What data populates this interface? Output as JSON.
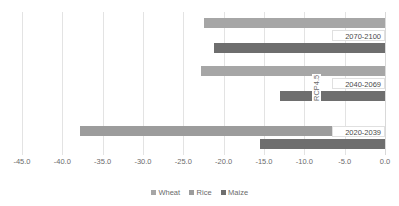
{
  "chart_data": {
    "type": "bar",
    "orientation": "horizontal",
    "title": "",
    "xlabel": "",
    "ylabel": "RCP4.5",
    "xlim": [
      -45.0,
      0.0
    ],
    "grid": true,
    "legend_position": "bottom",
    "categories": [
      "2070-2100",
      "2040-2069",
      "2020-2039"
    ],
    "xticks": [
      "-45.0",
      "-40.0",
      "-35.0",
      "-30.0",
      "-25.0",
      "-20.0",
      "-15.0",
      "-10.0",
      "-5.0",
      "0.0"
    ],
    "xtick_values": [
      -45.0,
      -40.0,
      -35.0,
      -30.0,
      -25.0,
      -20.0,
      -15.0,
      -10.0,
      -5.0,
      0.0
    ],
    "series": [
      {
        "name": "Wheat",
        "color": "#a6a6a6",
        "values": [
          -22.5,
          -22.8,
          0.0
        ]
      },
      {
        "name": "Rice",
        "color": "#9c9c9c",
        "values": [
          0.0,
          0.0,
          -37.8
        ]
      },
      {
        "name": "Maize",
        "color": "#6e6e6e",
        "values": [
          -21.2,
          -13.0,
          -15.5
        ]
      }
    ],
    "data_labels": [
      "2070-2100",
      "2040-2069",
      "2020-2039"
    ]
  },
  "legend": {
    "items": [
      {
        "label": "Wheat",
        "color": "#a6a6a6"
      },
      {
        "label": "Rice",
        "color": "#9c9c9c"
      },
      {
        "label": "Maize",
        "color": "#6e6e6e"
      }
    ]
  },
  "axis": {
    "rotated_label": "RCP4.5"
  }
}
